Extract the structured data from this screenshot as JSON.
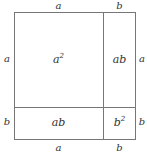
{
  "diagram": {
    "type": "area-model",
    "identity": "(a + b)^2 = a^2 + 2ab + b^2",
    "line_color": "#777777",
    "text_color": "#333333",
    "background_color": "#ffffff",
    "segments": {
      "horizontal": [
        "a",
        "b"
      ],
      "vertical": [
        "a",
        "b"
      ]
    },
    "cells": [
      {
        "id": "top-left",
        "base": "a",
        "sup": "2",
        "row": "a",
        "column": "a"
      },
      {
        "id": "top-right",
        "base": "ab",
        "sup": "",
        "row": "a",
        "column": "b"
      },
      {
        "id": "bottom-left",
        "base": "ab",
        "sup": "",
        "row": "b",
        "column": "a"
      },
      {
        "id": "bottom-right",
        "base": "b",
        "sup": "2",
        "row": "b",
        "column": "b"
      }
    ],
    "edges": {
      "top": [
        {
          "label": "a"
        },
        {
          "label": "b"
        }
      ],
      "bottom": [
        {
          "label": "a"
        },
        {
          "label": "b"
        }
      ],
      "left": [
        {
          "label": "a"
        },
        {
          "label": "b"
        }
      ],
      "right": [
        {
          "label": "a"
        },
        {
          "label": "b"
        }
      ]
    }
  }
}
